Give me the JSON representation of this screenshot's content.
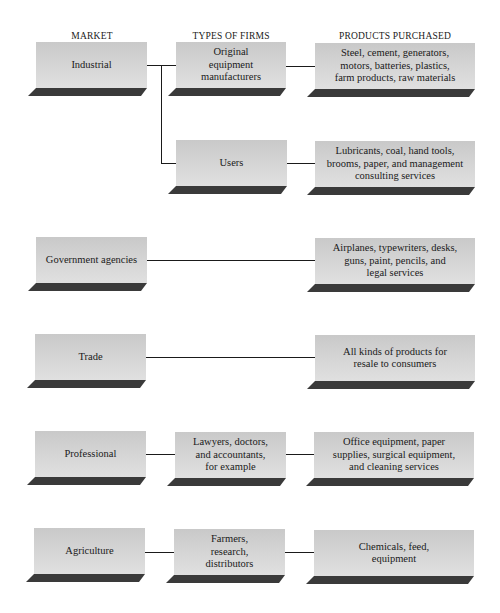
{
  "headers": {
    "market": "MARKET",
    "types": "TYPES OF FIRMS",
    "products": "PRODUCTS PURCHASED"
  },
  "rows": [
    {
      "market": "Industrial",
      "firm": [
        "Original",
        "equipment",
        "manufacturers"
      ],
      "products": [
        "Steel, cement, generators,",
        "motors, batteries, plastics,",
        "farm products, raw materials"
      ]
    },
    {
      "market": "",
      "firm": [
        "Users"
      ],
      "products": [
        "Lubricants, coal, hand tools,",
        "brooms, paper, and management",
        "consulting services"
      ]
    },
    {
      "market": "Government agencies",
      "firm": [],
      "products": [
        "Airplanes, typewriters, desks,",
        "guns, paint, pencils, and",
        "legal services"
      ]
    },
    {
      "market": "Trade",
      "firm": [],
      "products": [
        "All kinds of products for",
        "resale to consumers"
      ]
    },
    {
      "market": "Professional",
      "firm": [
        "Lawyers, doctors,",
        "and accountants,",
        "for example"
      ],
      "products": [
        "Office equipment, paper",
        "supplies, surgical equipment,",
        "and cleaning services"
      ]
    },
    {
      "market": "Agriculture",
      "firm": [
        "Farmers,",
        "research,",
        "distributors"
      ],
      "products": [
        "Chemicals, feed,",
        "equipment"
      ]
    }
  ],
  "colors": {
    "box_fill": "#d4d4d4",
    "shadow": "#3a3a3a",
    "line": "#1a1a1a"
  }
}
